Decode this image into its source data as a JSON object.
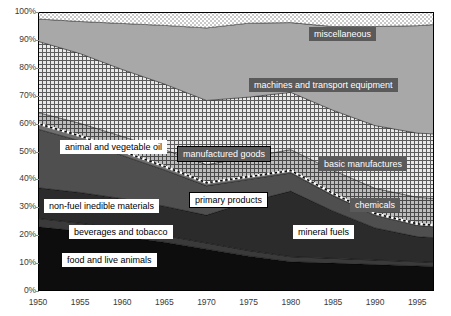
{
  "chart_data": {
    "type": "area",
    "title": "",
    "subtitle": "",
    "xlabel": "",
    "ylabel": "",
    "stacked": true,
    "percent": true,
    "grid": false,
    "legend": "inline-annotations",
    "xlim": [
      1950,
      1997
    ],
    "ylim": [
      0,
      100
    ],
    "x_ticks": [
      "1950",
      "1955",
      "1960",
      "1965",
      "1970",
      "1975",
      "1980",
      "1985",
      "1990",
      "1995"
    ],
    "x_tick_values": [
      1950,
      1955,
      1960,
      1965,
      1970,
      1975,
      1980,
      1985,
      1990,
      1995
    ],
    "y_ticks": [
      "0%",
      "10%",
      "20%",
      "30%",
      "40%",
      "50%",
      "60%",
      "70%",
      "80%",
      "90%",
      "100%"
    ],
    "y_tick_values": [
      0,
      10,
      20,
      30,
      40,
      50,
      60,
      70,
      80,
      90,
      100
    ],
    "x": [
      1950,
      1955,
      1960,
      1965,
      1970,
      1975,
      1980,
      1985,
      1990,
      1995,
      1997
    ],
    "series": [
      {
        "name": "food and live animals",
        "group": "primary products",
        "fill": "#0d0d0d",
        "values": [
          23.0,
          21.5,
          19.5,
          17.5,
          15.0,
          12.5,
          10.5,
          10.0,
          9.5,
          9.0,
          8.8
        ]
      },
      {
        "name": "beverages and tobacco",
        "group": "primary products",
        "fill": "#3a3a3a",
        "values": [
          3.0,
          2.8,
          2.6,
          2.4,
          2.2,
          2.0,
          1.8,
          1.7,
          1.6,
          1.5,
          1.5
        ]
      },
      {
        "name": "mineral fuels",
        "group": "primary products",
        "fill": "#2b2b2b",
        "values": [
          11.0,
          11.0,
          11.0,
          10.5,
          10.0,
          17.5,
          23.5,
          17.0,
          11.5,
          9.0,
          8.8
        ]
      },
      {
        "name": "non-fuel inedible materials",
        "group": "primary products",
        "fill": "#4f4f4f",
        "values": [
          21.0,
          18.5,
          15.5,
          13.0,
          10.5,
          8.0,
          6.5,
          5.5,
          4.5,
          4.0,
          3.9
        ]
      },
      {
        "name": "animal and vegetable oil",
        "group": "primary products",
        "fill": "#6e6e6e",
        "values": [
          2.0,
          1.8,
          1.5,
          1.3,
          1.1,
          1.0,
          0.9,
          0.8,
          0.7,
          0.6,
          0.6
        ]
      },
      {
        "name": "chemicals",
        "group": "manufactured goods",
        "fill": "#8d8d8d",
        "pattern": "crosshatch",
        "values": [
          4.0,
          4.5,
          5.3,
          6.0,
          6.5,
          7.0,
          7.5,
          8.3,
          9.0,
          9.5,
          9.6
        ]
      },
      {
        "name": "basic manufactures",
        "group": "manufactured goods",
        "fill": "#b5b5b5",
        "pattern": "grid",
        "values": [
          25.5,
          25.0,
          24.0,
          23.5,
          23.0,
          21.5,
          20.5,
          21.5,
          22.5,
          23.0,
          23.1
        ]
      },
      {
        "name": "machines and transport equipment",
        "group": "manufactured goods",
        "fill": "#a8a8a8",
        "pattern": "solid",
        "values": [
          8.0,
          11.5,
          16.5,
          21.0,
          26.0,
          26.5,
          25.0,
          30.0,
          35.5,
          38.5,
          39.2
        ]
      },
      {
        "name": "miscellaneous",
        "group": "manufactured goods",
        "fill": "#d8d8d8",
        "pattern": "dots",
        "values": [
          2.5,
          3.4,
          4.1,
          4.8,
          5.7,
          4.0,
          3.8,
          5.2,
          5.2,
          4.9,
          4.5
        ]
      }
    ],
    "boundaries": {
      "primary_products_share": [
        60.0,
        55.6,
        50.1,
        44.7,
        38.8,
        41.0,
        43.2,
        35.0,
        27.8,
        24.1,
        23.6
      ],
      "manufactured_goods_share": [
        40.0,
        44.4,
        49.9,
        55.3,
        61.2,
        59.0,
        56.8,
        65.0,
        72.2,
        75.9,
        76.4
      ]
    },
    "annotations": [
      {
        "text": "miscellaneous",
        "style": "dark",
        "x_pct": 77.0,
        "y_pct": 92.0
      },
      {
        "text": "machines and transport equipment",
        "style": "dark",
        "x_pct": 72.0,
        "y_pct": 74.0
      },
      {
        "text": "basic manufactures",
        "style": "dark",
        "x_pct": 82.0,
        "y_pct": 45.5
      },
      {
        "text": "chemicals",
        "style": "dark",
        "x_pct": 85.0,
        "y_pct": 31.0
      },
      {
        "text": "manufactured  goods",
        "style": "dark-border",
        "x_pct": 47.0,
        "y_pct": 49.0
      },
      {
        "text": "animal and vegetable oil",
        "style": "white",
        "x_pct": 19.0,
        "y_pct": 51.5
      },
      {
        "text": "primary products",
        "style": "white-border",
        "x_pct": 48.0,
        "y_pct": 32.5
      },
      {
        "text": "non-fuel inedible materials",
        "style": "white",
        "x_pct": 16.0,
        "y_pct": 30.5
      },
      {
        "text": "beverages and tobacco",
        "style": "white",
        "x_pct": 21.0,
        "y_pct": 21.0
      },
      {
        "text": "food and live animals",
        "style": "white",
        "x_pct": 18.0,
        "y_pct": 11.0
      },
      {
        "text": "mineral fuels",
        "style": "white",
        "x_pct": 72.0,
        "y_pct": 21.0
      }
    ]
  }
}
